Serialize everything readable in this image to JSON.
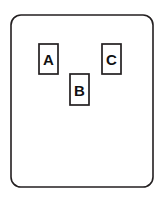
{
  "diagram": {
    "background_color": "#ffffff",
    "line_color": "#231f20",
    "label_color": "#111111",
    "frame": {
      "name": "outer-rounded-rectangle",
      "x": 11,
      "y": 15,
      "width": 142,
      "height": 172,
      "corner_radius": 10,
      "stroke_width": 1.6,
      "fill": "#ffffff"
    },
    "nodes": [
      {
        "id": "A",
        "label": "A",
        "x": 39,
        "y": 44,
        "width": 19,
        "height": 30,
        "center_x": 48.5,
        "center_y": 59,
        "stroke_width": 1.7,
        "fill": "#ffffff"
      },
      {
        "id": "B",
        "label": "B",
        "x": 70,
        "y": 74,
        "width": 19,
        "height": 31,
        "center_x": 79.5,
        "center_y": 89.5,
        "stroke_width": 1.7,
        "fill": "#ffffff"
      },
      {
        "id": "C",
        "label": "C",
        "x": 102,
        "y": 44,
        "width": 19,
        "height": 30,
        "center_x": 111.5,
        "center_y": 59,
        "stroke_width": 1.7,
        "fill": "#ffffff"
      }
    ]
  }
}
